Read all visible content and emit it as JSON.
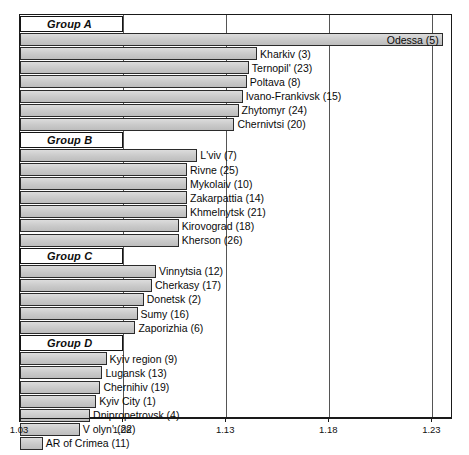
{
  "chart_data": {
    "type": "bar",
    "orientation": "horizontal",
    "title": "",
    "subtitle": "",
    "xlabel": "",
    "ylabel": "",
    "xlim": [
      1.03,
      1.24
    ],
    "grid": true,
    "legend": "none",
    "tick_labels": [
      "1.03",
      "1.08",
      "1.13",
      "1.18",
      "1.23"
    ],
    "tick_values": [
      1.03,
      1.08,
      1.13,
      1.18,
      1.23
    ],
    "groups": [
      {
        "name": "Group A",
        "items": [
          {
            "label": "Odessa (5)",
            "region": "Odessa",
            "code": 5,
            "value": 1.235,
            "label_side": "left"
          },
          {
            "label": "Kharkiv (3)",
            "region": "Kharkiv",
            "code": 3,
            "value": 1.145,
            "label_side": "right"
          },
          {
            "label": "Ternopil' (23)",
            "region": "Ternopil'",
            "code": 23,
            "value": 1.141,
            "label_side": "right"
          },
          {
            "label": "Poltava (8)",
            "region": "Poltava",
            "code": 8,
            "value": 1.14,
            "label_side": "right"
          },
          {
            "label": "Ivano-Frankivsk (15)",
            "region": "Ivano-Frankivsk",
            "code": 15,
            "value": 1.138,
            "label_side": "right"
          },
          {
            "label": "Zhytomyr (24)",
            "region": "Zhytomyr",
            "code": 24,
            "value": 1.136,
            "label_side": "right"
          },
          {
            "label": "Chernivtsi (20)",
            "region": "Chernivtsi",
            "code": 20,
            "value": 1.134,
            "label_side": "right"
          }
        ]
      },
      {
        "name": "Group B",
        "items": [
          {
            "label": "L'viv (7)",
            "region": "L'viv",
            "code": 7,
            "value": 1.116,
            "label_side": "right"
          },
          {
            "label": "Rivne (25)",
            "region": "Rivne",
            "code": 25,
            "value": 1.111,
            "label_side": "right"
          },
          {
            "label": "Mykolaiv (10)",
            "region": "Mykolaiv",
            "code": 10,
            "value": 1.111,
            "label_side": "right"
          },
          {
            "label": "Zakarpattia (14)",
            "region": "Zakarpattia",
            "code": 14,
            "value": 1.111,
            "label_side": "right"
          },
          {
            "label": "Khmelnytsk (21)",
            "region": "Khmelnytsk",
            "code": 21,
            "value": 1.111,
            "label_side": "right"
          },
          {
            "label": "Kirovograd (18)",
            "region": "Kirovograd",
            "code": 18,
            "value": 1.107,
            "label_side": "right"
          },
          {
            "label": "Kherson (26)",
            "region": "Kherson",
            "code": 26,
            "value": 1.107,
            "label_side": "right"
          }
        ]
      },
      {
        "name": "Group C",
        "items": [
          {
            "label": "Vinnytsia (12)",
            "region": "Vinnytsia",
            "code": 12,
            "value": 1.096,
            "label_side": "right"
          },
          {
            "label": "Cherkasy (17)",
            "region": "Cherkasy",
            "code": 17,
            "value": 1.094,
            "label_side": "right"
          },
          {
            "label": "Donetsk (2)",
            "region": "Donetsk",
            "code": 2,
            "value": 1.09,
            "label_side": "right"
          },
          {
            "label": "Sumy (16)",
            "region": "Sumy",
            "code": 16,
            "value": 1.087,
            "label_side": "right"
          },
          {
            "label": "Zaporizhia (6)",
            "region": "Zaporizhia",
            "code": 6,
            "value": 1.086,
            "label_side": "right"
          }
        ]
      },
      {
        "name": "Group D",
        "items": [
          {
            "label": "Kyiv region (9)",
            "region": "Kyiv region",
            "code": 9,
            "value": 1.072,
            "label_side": "right"
          },
          {
            "label": "Lugansk (13)",
            "region": "Lugansk",
            "code": 13,
            "value": 1.07,
            "label_side": "right"
          },
          {
            "label": "Chernihiv (19)",
            "region": "Chernihiv",
            "code": 19,
            "value": 1.069,
            "label_side": "right"
          },
          {
            "label": "Kyiv City (1)",
            "region": "Kyiv City",
            "code": 1,
            "value": 1.067,
            "label_side": "right"
          },
          {
            "label": "Dnipropetrovsk (4)",
            "region": "Dnipropetrovsk",
            "code": 4,
            "value": 1.064,
            "label_side": "right"
          },
          {
            "label": "V olyn' (22)",
            "region": "Volyn'",
            "code": 22,
            "value": 1.059,
            "label_side": "right"
          },
          {
            "label": "AR of Crimea (11)",
            "region": "AR of Crimea",
            "code": 11,
            "value": 1.041,
            "label_side": "right"
          }
        ]
      }
    ]
  },
  "colors": {
    "bar_fill": "#cfcfcf",
    "bar_stroke": "#2b2b2b",
    "frame": "#1a1a1a",
    "gridline": "#555555",
    "text": "#0a0a0a",
    "background": "#ffffff"
  }
}
